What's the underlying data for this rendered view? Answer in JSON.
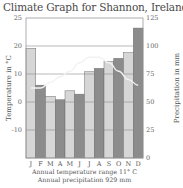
{
  "title": "Climate Graph for Shannon, Ireland, 53°N",
  "footer": {
    "temp_range": "Annual temperature range 11° C",
    "precip": "Annual precipitation 929 mm"
  },
  "colors": {
    "bar_light": "#d6d6d6",
    "bar_dark": "#8c8c8c",
    "bar_stroke": "#6e6e6e",
    "grid": "#8a8a8a",
    "frame": "#9a9a9a",
    "temp_line": "#f2f2f2"
  },
  "chart_data": {
    "type": "bar",
    "title": "Climate Graph for Shannon, Ireland, 53°N",
    "categories": [
      "J",
      "F",
      "M",
      "A",
      "M",
      "J",
      "J",
      "A",
      "S",
      "O",
      "N",
      "D"
    ],
    "series": [
      {
        "name": "Precipitation (mm)",
        "axis": "right",
        "type": "bar",
        "values": [
          98,
          65,
          55,
          52,
          60,
          57,
          77,
          80,
          86,
          89,
          94,
          116
        ]
      },
      {
        "name": "Temperature (°C)",
        "axis": "left",
        "type": "line",
        "values": [
          5,
          5,
          7,
          9,
          11,
          14,
          16,
          16,
          14,
          11,
          8,
          6
        ]
      }
    ],
    "ylabel_left": "Temperature in °C",
    "ylabel_right": "Precipitation in mm",
    "left_ticks": [
      "25",
      "20",
      "10",
      "0",
      "-10"
    ],
    "right_ticks": [
      "125",
      "100",
      "75",
      "50",
      "25",
      "0"
    ],
    "ylim_right": [
      0,
      125
    ],
    "ylim_left": [
      -20,
      25
    ],
    "grid": true,
    "annotations": [
      "Annual temperature range 11° C",
      "Annual precipitation 929 mm"
    ]
  }
}
